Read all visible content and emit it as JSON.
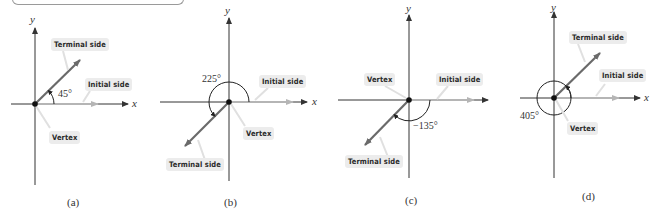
{
  "colors": {
    "axis": "#333333",
    "terminal_side": "#6a6a6a",
    "initial_side": "#b5b5b5",
    "label_bg": "#ececec",
    "vertex": "#111111"
  },
  "axis_labels": {
    "x": "x",
    "y": "y"
  },
  "panels": [
    {
      "id": "a",
      "caption": "(a)",
      "angle_label": "45°",
      "angle_degrees": 45,
      "labels": {
        "terminal": "Terminal side",
        "initial": "Initial side",
        "vertex": "Vertex"
      }
    },
    {
      "id": "b",
      "caption": "(b)",
      "angle_label": "225°",
      "angle_degrees": 225,
      "labels": {
        "terminal": "Terminal side",
        "initial": "Initial side",
        "vertex": "Vertex"
      }
    },
    {
      "id": "c",
      "caption": "(c)",
      "angle_label": "−135°",
      "angle_degrees": -135,
      "labels": {
        "terminal": "Terminal side",
        "initial": "Initial side",
        "vertex": "Vertex"
      }
    },
    {
      "id": "d",
      "caption": "(d)",
      "angle_label": "405°",
      "angle_degrees": 405,
      "labels": {
        "terminal": "Terminal side",
        "initial": "Initial side",
        "vertex": "Vertex"
      }
    }
  ]
}
